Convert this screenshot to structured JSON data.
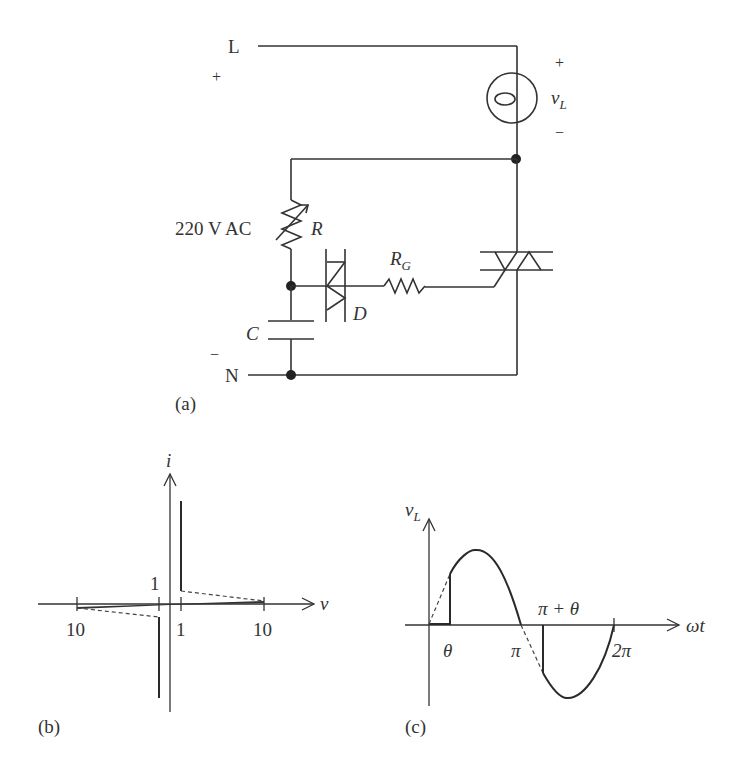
{
  "panel_a": {
    "caption": "(a)",
    "node_L": "L",
    "node_N": "N",
    "source_plus": "+",
    "source_minus": "−",
    "source_label": "220 V AC",
    "load_plus": "+",
    "load_minus": "−",
    "load_label_main": "v",
    "load_label_sub": "L",
    "resistor_label": "R",
    "gate_resistor_main": "R",
    "gate_resistor_sub": "G",
    "diac_label": "D",
    "capacitor_label": "C"
  },
  "panel_b": {
    "caption": "(b)",
    "y_axis_label": "i",
    "x_axis_label": "v",
    "tick_neg10": "10",
    "tick_neg1": "1",
    "tick_pos1": "1",
    "tick_pos10": "10"
  },
  "panel_c": {
    "caption": "(c)",
    "y_axis_label_main": "v",
    "y_axis_label_sub": "L",
    "x_axis_label": "ωt",
    "tick_theta": "θ",
    "tick_pi": "π",
    "tick_pi_plus_theta": "π + θ",
    "tick_2pi": "2π"
  },
  "colors": {
    "line": "#333333",
    "background": "#ffffff"
  }
}
